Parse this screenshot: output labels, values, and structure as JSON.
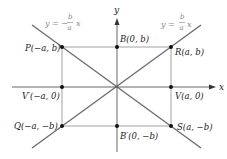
{
  "diagram": {
    "axes": {
      "x_label": "x",
      "y_label": "y"
    },
    "asymptotes": [
      {
        "name": "negative-slope",
        "prefix": "y = −",
        "num": "b",
        "den": "a",
        "suffix": "x"
      },
      {
        "name": "positive-slope",
        "prefix": "y = ",
        "num": "b",
        "den": "a",
        "suffix": "x"
      }
    ],
    "points": {
      "P": "P(−a, b)",
      "B": "B(0, b)",
      "R": "R(a, b)",
      "Vp": "V′(−a, 0)",
      "V": "V(a, 0)",
      "Q": "Q(−a, −b)",
      "Bp": "B′(0, −b)",
      "S": "S(a, −b)"
    },
    "colors": {
      "axis": "#555555",
      "asymptote": "#777777",
      "rect": "#888888",
      "point": "#111111"
    }
  }
}
